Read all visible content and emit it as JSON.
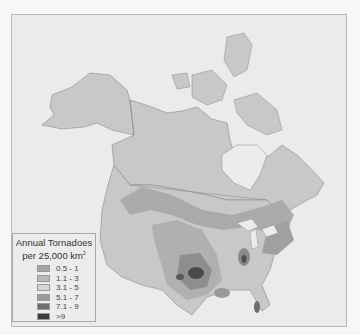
{
  "map": {
    "title": "Annual Tornadoes per 25,000 km²",
    "colors": {
      "ocean": "#ececec",
      "land": "#c9c9c9",
      "borders": "#8a8a8a",
      "water": "#e6e6e6"
    }
  },
  "legend": {
    "title_line1": "Annual Tornadoes",
    "title_line2": "per 25,000 km",
    "title_sup": "2",
    "items": [
      {
        "label": "0.5 - 1",
        "color": "#a6a6a6"
      },
      {
        "label": "1.1 - 3",
        "color": "#b8b8b8"
      },
      {
        "label": "3.1 - 5",
        "color": "#d6d6d6"
      },
      {
        "label": "5.1 - 7",
        "color": "#9a9a9a"
      },
      {
        "label": "7.1 - 9",
        "color": "#6e6e6e"
      },
      {
        "label": ">9",
        "color": "#3c3c3c"
      }
    ]
  }
}
